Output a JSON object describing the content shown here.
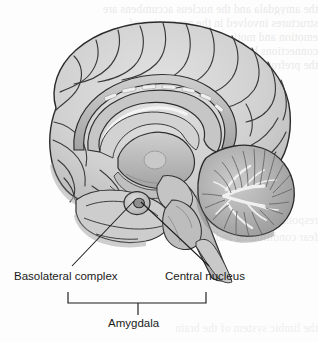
{
  "figure": {
    "view": "mid-sagittal section",
    "background_color": "#fdfdfd",
    "ink_color": "#1b1b1b"
  },
  "palette": {
    "outline": "#2a2a2a",
    "cortex_light": "#d8d8d8",
    "cortex_mid": "#c2c2c2",
    "cortex_shadow": "#a8a8a8",
    "deep_structure": "#b4b4b4",
    "deep_shadow": "#8f8f8f",
    "highlight": "#ececec",
    "cerebellum_fill": "#bdbdbd",
    "cerebellum_dark": "#8a8a8a",
    "arbor_vitae": "#f2f2f2",
    "brainstem": "#c8c8c8",
    "amygdala_ring": "#cfcfcf",
    "amygdala_core": "#9a9a9a",
    "ghost_text": "#e9e9e9"
  },
  "labels": {
    "basolateral": "Basolateral complex",
    "central": "Central nucleus",
    "amygdala": "Amygdala"
  },
  "leaders": {
    "basolateral_line": {
      "x1": 72,
      "y1": 266,
      "x2": 134,
      "y2": 201
    },
    "central_line": {
      "x1": 209,
      "y1": 266,
      "x2": 141,
      "y2": 202
    }
  },
  "bracket": {
    "left_x": 68,
    "right_x": 206,
    "top_y": 292,
    "bar_y": 303,
    "stem_x": 138,
    "stem_bottom_y": 315
  },
  "structures": [
    {
      "name": "cerebral-cortex",
      "region": "cerebrum"
    },
    {
      "name": "corpus-callosum",
      "region": "commissure"
    },
    {
      "name": "cingulate-gyrus",
      "region": "limbic"
    },
    {
      "name": "lateral-ventricle",
      "region": "ventricle"
    },
    {
      "name": "thalamus",
      "region": "diencephalon"
    },
    {
      "name": "midbrain",
      "region": "brainstem"
    },
    {
      "name": "pons",
      "region": "brainstem"
    },
    {
      "name": "medulla-oblongata",
      "region": "brainstem"
    },
    {
      "name": "cerebellum",
      "region": "hindbrain"
    },
    {
      "name": "arbor-vitae",
      "region": "hindbrain"
    },
    {
      "name": "temporal-lobe",
      "region": "cerebrum"
    },
    {
      "name": "amygdala-basolateral-complex",
      "region": "limbic"
    },
    {
      "name": "amygdala-central-nucleus",
      "region": "limbic"
    }
  ],
  "ghost_lines": {
    "a": "the amygdala and the nucleus accumbens are",
    "b": "structures involved in the processing of",
    "c": "emotion and motivation in the brain",
    "d": "connections between these regions and",
    "e": "the prefrontal cortex are extensive",
    "f": "responses to threatening stimuli",
    "g": "fear conditioning and extinction",
    "h": "the limbic system of the brain"
  }
}
